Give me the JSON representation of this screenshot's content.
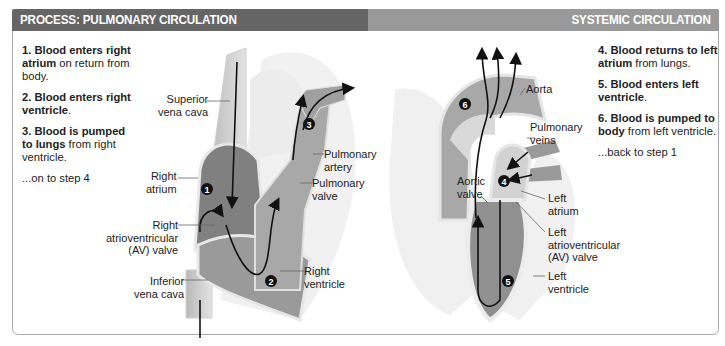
{
  "header": {
    "left_title": "PROCESS: PULMONARY CIRCULATION",
    "right_title": "SYSTEMIC CIRCULATION",
    "left_color": "#656565",
    "right_color": "#999999"
  },
  "pulmonary_steps": [
    {
      "num": "1.",
      "bold": "Blood enters right atrium",
      "rest": " on return from body."
    },
    {
      "num": "2.",
      "bold": "Blood enters right ventricle",
      "rest": "."
    },
    {
      "num": "3.",
      "bold": "Blood is pumped to lungs",
      "rest": " from right ventricle."
    }
  ],
  "pulmonary_next": "...on to step 4",
  "systemic_steps": [
    {
      "num": "4.",
      "bold": "Blood returns to left atrium",
      "rest": " from lungs."
    },
    {
      "num": "5.",
      "bold": "Blood enters left ventricle",
      "rest": "."
    },
    {
      "num": "6.",
      "bold": "Blood is pumped to body",
      "rest": " from left ventricle."
    }
  ],
  "systemic_next": "...back to step 1",
  "right_heart_labels": {
    "superior_vena_cava": [
      "Superior",
      "vena cava"
    ],
    "right_atrium": [
      "Right",
      "atrium"
    ],
    "right_av_valve": [
      "Right",
      "atrioventricular",
      "(AV) valve"
    ],
    "inferior_vena_cava": [
      "Inferior",
      "vena cava"
    ],
    "pulmonary_artery": [
      "Pulmonary",
      "artery"
    ],
    "pulmonary_valve": [
      "Pulmonary",
      "valve"
    ],
    "right_ventricle": [
      "Right",
      "ventricle"
    ]
  },
  "left_heart_labels": {
    "aorta": [
      "Aorta"
    ],
    "pulmonary_veins": [
      "Pulmonary",
      "veins"
    ],
    "aortic_valve": [
      "Aortic",
      "valve"
    ],
    "left_atrium": [
      "Left",
      "atrium"
    ],
    "left_av_valve": [
      "Left",
      "atrioventricular",
      "(AV) valve"
    ],
    "left_ventricle": [
      "Left",
      "ventricle"
    ]
  },
  "step_markers": [
    "1",
    "2",
    "3",
    "4",
    "5",
    "6"
  ]
}
